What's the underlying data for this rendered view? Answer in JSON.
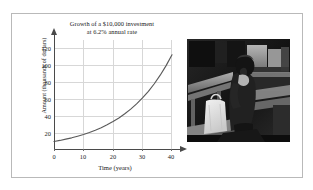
{
  "figure": {
    "border_color": "#b9b9b9",
    "background": "#ffffff"
  },
  "chart_data": {
    "type": "line",
    "title": "Growth of a $10,000 investment at 6.2% annual rate",
    "title_lines": [
      "Growth of a $10,000 investment",
      "at 6.2% annual rate"
    ],
    "xlabel": "Time (years)",
    "ylabel": "Amount (thousands of dollars)",
    "xlim": [
      0,
      42
    ],
    "ylim": [
      0,
      130
    ],
    "xticks": [
      0,
      10,
      20,
      30,
      40
    ],
    "xtick_labels": [
      "0",
      "10",
      "20",
      "30",
      "40"
    ],
    "yticks": [
      20,
      40,
      60,
      80,
      100,
      120
    ],
    "ytick_labels": [
      "20",
      "40",
      "60",
      "80",
      "100",
      "120"
    ],
    "grid": true,
    "legend": null,
    "series": [
      {
        "name": "Value of investment",
        "color": "#5a5a5a",
        "formula": "10 * 1.062^t",
        "x": [
          0,
          2,
          4,
          6,
          8,
          10,
          12,
          14,
          16,
          18,
          20,
          22,
          24,
          26,
          28,
          30,
          32,
          34,
          36,
          38,
          40
        ],
        "values": [
          10.0,
          11.3,
          12.8,
          14.4,
          16.3,
          18.3,
          20.7,
          23.4,
          26.4,
          29.8,
          33.6,
          37.9,
          42.8,
          48.3,
          54.5,
          61.5,
          69.4,
          78.3,
          88.4,
          99.7,
          112.5
        ]
      }
    ]
  },
  "photo": {
    "caption": "",
    "alt_name": "person-seated-on-bench-photo",
    "palette": {
      "dark": "#1b1917",
      "mid": "#57514a",
      "light": "#cdc7bd",
      "highlight": "#efe9e0"
    }
  }
}
